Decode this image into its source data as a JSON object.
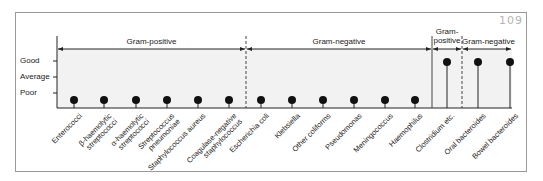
{
  "badge": "109",
  "y_axis": {
    "levels": [
      "Good",
      "Average",
      "Poor"
    ]
  },
  "groups": [
    {
      "label": "Gram-positive",
      "x_start": 57,
      "x_end": 246
    },
    {
      "label": "Gram-negative",
      "x_start": 246,
      "x_end": 432
    },
    {
      "label": "Gram-\npositive",
      "x_start": 432,
      "x_end": 462
    },
    {
      "label": "Gram-negative",
      "x_start": 462,
      "x_end": 512
    }
  ],
  "chart_data": {
    "type": "lollipop",
    "title": "",
    "xlabel": "",
    "ylabel": "",
    "y_levels": [
      "Poor",
      "Average",
      "Good"
    ],
    "categories": [
      "Enterococci",
      "β-haemolytic streptococci",
      "α-haemolytic streptococci",
      "Streptococcus pneumoniae",
      "Staphylococcus aureus",
      "Coagulase-negative staphylococcus",
      "Escherichia coli",
      "Klebsiella",
      "Other coliforms",
      "Pseudomonas",
      "Meningococcus",
      "Haemophilus",
      "Clostridium etc.",
      "Oral bacteroides",
      "Bowel bacteroides"
    ],
    "values": [
      "Poor",
      "Poor",
      "Poor",
      "Poor",
      "Poor",
      "Poor",
      "Poor",
      "Poor",
      "Poor",
      "Poor",
      "Poor",
      "Poor",
      "Good",
      "Good",
      "Good"
    ],
    "group_brackets": [
      {
        "label": "Gram-positive",
        "categories": [
          "Enterococci",
          "β-haemolytic streptococci",
          "α-haemolytic streptococci",
          "Streptococcus pneumoniae",
          "Staphylococcus aureus",
          "Coagulase-negative staphylococcus"
        ]
      },
      {
        "label": "Gram-negative",
        "categories": [
          "Escherichia coli",
          "Klebsiella",
          "Other coliforms",
          "Pseudomonas",
          "Meningococcus",
          "Haemophilus"
        ]
      },
      {
        "label": "Gram-positive",
        "categories": [
          "Clostridium etc."
        ]
      },
      {
        "label": "Gram-negative",
        "categories": [
          "Oral bacteroides",
          "Bowel bacteroides"
        ]
      }
    ]
  },
  "labels": [
    {
      "l1": "Enterococci",
      "l2": ""
    },
    {
      "l1": "β-haemolytic",
      "l2": "streptococci"
    },
    {
      "l1": "α-haemolytic",
      "l2": "streptococci"
    },
    {
      "l1": "Streptococcus",
      "l2": "pneumoniae"
    },
    {
      "l1": "Staphylococcus aureus",
      "l2": ""
    },
    {
      "l1": "Coagulase-negative",
      "l2": "staphylococcus"
    },
    {
      "l1": "Escherichia coli",
      "l2": ""
    },
    {
      "l1": "Klebsiella",
      "l2": ""
    },
    {
      "l1": "Other coliforms",
      "l2": ""
    },
    {
      "l1": "Pseudomonas",
      "l2": ""
    },
    {
      "l1": "Meningococcus",
      "l2": ""
    },
    {
      "l1": "Haemophilus",
      "l2": ""
    },
    {
      "l1": "Clostridium etc.",
      "l2": ""
    },
    {
      "l1": "Oral bacteroides",
      "l2": ""
    },
    {
      "l1": "Bowel bacteroides",
      "l2": ""
    }
  ]
}
